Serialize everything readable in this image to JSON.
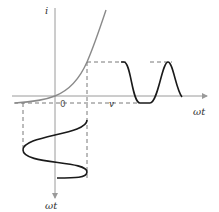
{
  "diagram": {
    "labels": {
      "y_axis": "i",
      "x_axis_voltage": "v",
      "origin": "0",
      "time_right": "ωt",
      "time_bottom": "ωt"
    },
    "colors": {
      "axis": "#9a9a9a",
      "characteristic_curve": "#8a8a8a",
      "waveform": "#1a1a1a",
      "dashed": "#555555"
    }
  }
}
